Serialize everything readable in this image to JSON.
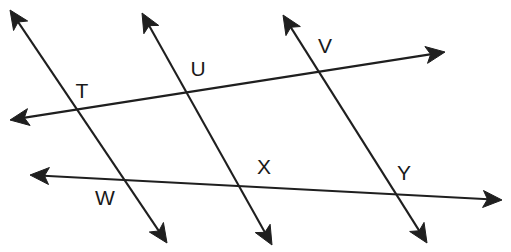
{
  "figure": {
    "background_color": "#ffffff",
    "stroke_color": "#1f1f1f",
    "label_color": "#1a1a1a",
    "width": 511,
    "height": 252
  },
  "labels": [
    {
      "id": "T",
      "text": "T",
      "x": 82,
      "y": 92
    },
    {
      "id": "U",
      "text": "U",
      "x": 198,
      "y": 70
    },
    {
      "id": "V",
      "text": "V",
      "x": 325,
      "y": 47
    },
    {
      "id": "W",
      "text": "W",
      "x": 105,
      "y": 199
    },
    {
      "id": "X",
      "text": "X",
      "x": 264,
      "y": 168
    },
    {
      "id": "Y",
      "text": "Y",
      "x": 404,
      "y": 174
    }
  ],
  "lines": [
    {
      "id": "line-TUV",
      "name": "upper-horizontal-line",
      "from": {
        "x": 10,
        "y": 120
      },
      "to": {
        "x": 445,
        "y": 52
      },
      "arrow_start": true,
      "arrow_end": true,
      "passes_through": [
        "T",
        "U",
        "V"
      ]
    },
    {
      "id": "line-WXY",
      "name": "lower-horizontal-line",
      "from": {
        "x": 30,
        "y": 175
      },
      "to": {
        "x": 502,
        "y": 200
      },
      "arrow_start": true,
      "arrow_end": true,
      "passes_through": [
        "W",
        "X",
        "Y"
      ]
    },
    {
      "id": "line-TW",
      "name": "transversal-left",
      "from": {
        "x": 10,
        "y": 10
      },
      "to": {
        "x": 167,
        "y": 243
      },
      "arrow_start": true,
      "arrow_end": true,
      "passes_through": [
        "T",
        "W"
      ]
    },
    {
      "id": "line-UX",
      "name": "transversal-middle",
      "from": {
        "x": 142,
        "y": 13
      },
      "to": {
        "x": 272,
        "y": 245
      },
      "arrow_start": true,
      "arrow_end": true,
      "passes_through": [
        "U",
        "X"
      ]
    },
    {
      "id": "line-VY",
      "name": "transversal-right",
      "from": {
        "x": 283,
        "y": 15
      },
      "to": {
        "x": 427,
        "y": 243
      },
      "arrow_start": true,
      "arrow_end": true,
      "passes_through": [
        "V",
        "Y"
      ]
    }
  ],
  "intersections": [
    {
      "label": "T",
      "x": 77,
      "y": 117,
      "lines": [
        "line-TUV",
        "line-TW"
      ]
    },
    {
      "label": "U",
      "x": 190,
      "y": 93,
      "lines": [
        "line-TUV",
        "line-UX"
      ]
    },
    {
      "label": "V",
      "x": 320,
      "y": 70,
      "lines": [
        "line-TUV",
        "line-VY"
      ]
    },
    {
      "label": "W",
      "x": 122,
      "y": 179,
      "lines": [
        "line-WXY",
        "line-TW"
      ]
    },
    {
      "label": "X",
      "x": 254,
      "y": 187,
      "lines": [
        "line-WXY",
        "line-UX"
      ]
    },
    {
      "label": "Y",
      "x": 398,
      "y": 195,
      "lines": [
        "line-WXY",
        "line-VY"
      ]
    }
  ]
}
